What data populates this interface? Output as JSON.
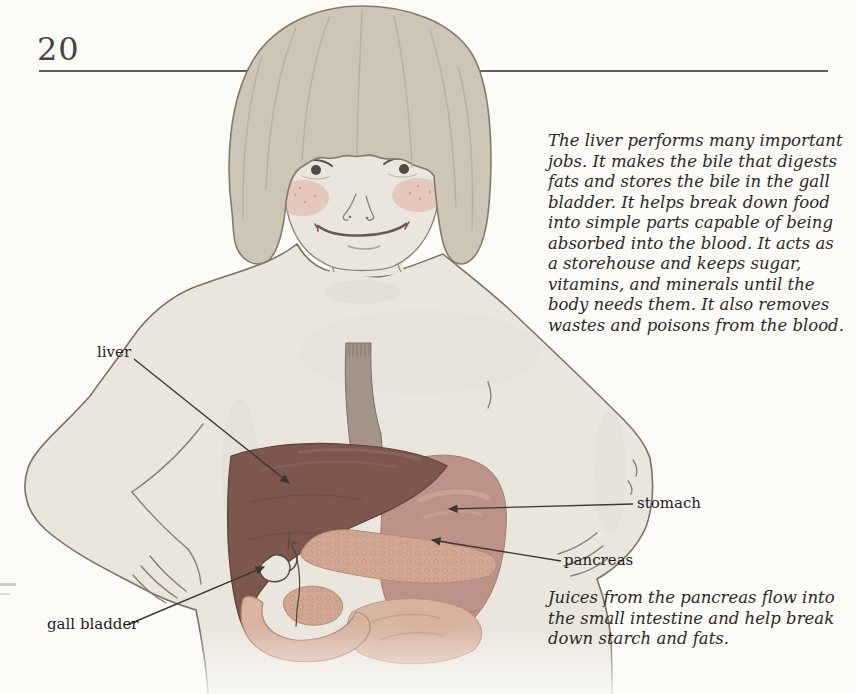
{
  "page": {
    "number": "20"
  },
  "paragraphs": {
    "liver_text": "The liver performs many important jobs. It makes the bile that digests fats and stores the bile in the gall bladder. It helps break down food into simple parts capable of being absorbed into the blood. It acts as a storehouse and keeps sugar, vitamins, and minerals until the body needs them. It also removes wastes and poisons from the blood.",
    "pancreas_text": "Juices from the pancreas flow into the small intestine and help break down starch and fats."
  },
  "labels": {
    "liver": "liver",
    "stomach": "stomach",
    "pancreas": "pancreas",
    "gall_bladder": "gall bladder"
  },
  "illustration": {
    "colors": {
      "skin": "#eae6de",
      "hair": "#cdc5b6",
      "cheek": "#dfaea2",
      "liver": "#7d574e",
      "stomach": "#bd9289",
      "pancreas": "#d2a793",
      "intestine": "#d9b4a1",
      "esophagus": "#a5948a",
      "gall_bladder": "#ece7dd"
    }
  }
}
